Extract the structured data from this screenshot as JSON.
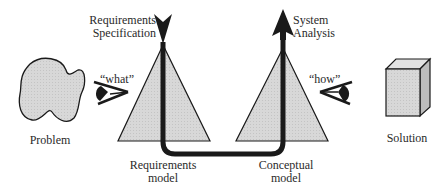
{
  "diagram": {
    "problem": {
      "label": "Problem"
    },
    "solution": {
      "label": "Solution"
    },
    "what_eye": {
      "label": "“what”"
    },
    "how_eye": {
      "label": "“how”"
    },
    "requirements_specification": {
      "line1": "Requirements",
      "line2": "Specification"
    },
    "system_analysis": {
      "line1": "System",
      "line2": "Analysis"
    },
    "requirements_model": {
      "line1": "Requirements",
      "line2": "model"
    },
    "conceptual_model": {
      "line1": "Conceptual",
      "line2": "model"
    },
    "colors": {
      "fill": "#d6d6d6",
      "stroke": "#1a1a1a",
      "text": "#2a2a2a"
    }
  }
}
